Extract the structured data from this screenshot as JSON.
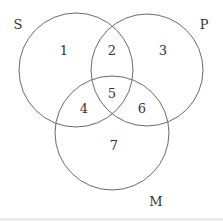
{
  "diagram": {
    "type": "venn",
    "sets": [
      {
        "id": "S",
        "label": "S",
        "cx": 76,
        "cy": 70,
        "r": 57,
        "label_x": 18,
        "label_y": 29
      },
      {
        "id": "P",
        "label": "P",
        "cx": 147,
        "cy": 70,
        "r": 56,
        "label_x": 204,
        "label_y": 29
      },
      {
        "id": "M",
        "label": "M",
        "cx": 112,
        "cy": 133,
        "r": 57,
        "label_x": 156,
        "label_y": 206
      }
    ],
    "regions": [
      {
        "number": "1",
        "x": 64,
        "y": 55
      },
      {
        "number": "2",
        "x": 112,
        "y": 55
      },
      {
        "number": "3",
        "x": 163,
        "y": 55
      },
      {
        "number": "4",
        "x": 84,
        "y": 107
      },
      {
        "number": "5",
        "x": 112,
        "y": 96
      },
      {
        "number": "6",
        "x": 142,
        "y": 107
      },
      {
        "number": "7",
        "x": 114,
        "y": 146
      }
    ],
    "stroke_color": "#6a6a6a",
    "text_color": "#333333"
  }
}
